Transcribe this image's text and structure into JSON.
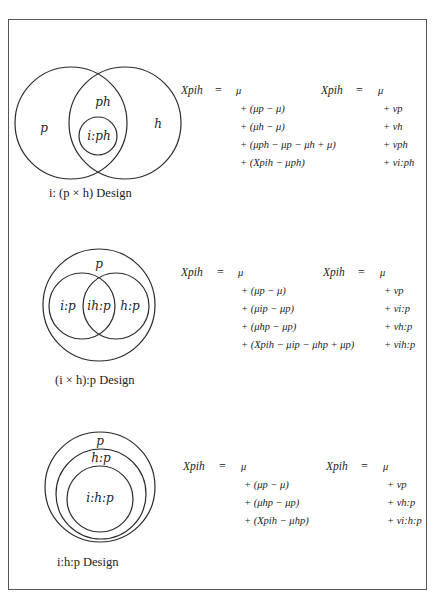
{
  "designs": [
    {
      "caption": "i: (p × h) Design",
      "labels": {
        "p": "p",
        "ph": "ph",
        "h": "h",
        "iph": "i:ph"
      },
      "model1": {
        "lhs": "Xpih",
        "eq": "=",
        "first": "μ",
        "terms": [
          "+ (μp − μ)",
          "+ (μh − μ)",
          "+ (μph − μp − μh + μ)",
          "+ (Xpih − μph)"
        ]
      },
      "model2": {
        "lhs": "Xpih",
        "eq": "=",
        "first": "μ",
        "terms": [
          "+ νp",
          "+ νh",
          "+ νph",
          "+ νi:ph"
        ]
      }
    },
    {
      "caption": "(i × h):p Design",
      "labels": {
        "p": "p",
        "ip": "i:p",
        "ihp": "ih:p",
        "hp": "h:p"
      },
      "model1": {
        "lhs": "Xpih",
        "eq": "=",
        "first": "μ",
        "terms": [
          "+ (μp − μ)",
          "+ (μip − μp)",
          "+ (μhp − μp)",
          "+ (Xpih − μip − μhp + μp)"
        ]
      },
      "model2": {
        "lhs": "Xpih",
        "eq": "=",
        "first": "μ",
        "terms": [
          "+ νp",
          "+ νi:p",
          "+ νh:p",
          "+ νih:p"
        ]
      }
    },
    {
      "caption": "i:h:p Design",
      "labels": {
        "p": "p",
        "hp": "h:p",
        "ihp": "i:h:p"
      },
      "model1": {
        "lhs": "Xpih",
        "eq": "=",
        "first": "μ",
        "terms": [
          "+ (μp − μ)",
          "+ (μhp − μp)",
          "+ (Xpih − μhp)"
        ]
      },
      "model2": {
        "lhs": "Xpih",
        "eq": "=",
        "first": "μ",
        "terms": [
          "+ νp",
          "+ νh:p",
          "+ νi:h:p"
        ]
      }
    }
  ]
}
